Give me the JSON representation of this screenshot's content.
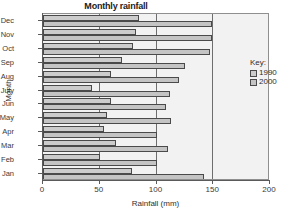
{
  "chart_data": {
    "type": "bar",
    "orientation": "horizontal",
    "title": "Monthly rainfall",
    "xlabel": "Rainfall (mm)",
    "ylabel": "Month",
    "xlim": [
      0,
      200
    ],
    "xticks": [
      0,
      50,
      100,
      150,
      200
    ],
    "xtick_labels": [
      "0",
      "50",
      "100",
      "150",
      "200"
    ],
    "grid": "vertical gridlines at 50, 100, 150",
    "legend_position": "right",
    "legend_title": "Key:",
    "categories": [
      "Jan",
      "Feb",
      "Mar",
      "Apr",
      "May",
      "Jun",
      "July",
      "Aug",
      "Sep",
      "Oct",
      "Nov",
      "Dec"
    ],
    "display_order_top_to_bottom": [
      "Dec",
      "Nov",
      "Oct",
      "Sep",
      "Aug",
      "July",
      "Jun",
      "May",
      "Apr",
      "Mar",
      "Feb",
      "Jan"
    ],
    "series": [
      {
        "name": "1990",
        "color": "#cccccc",
        "values": [
          78,
          50,
          64,
          54,
          56,
          60,
          43,
          60,
          70,
          79,
          82,
          85
        ]
      },
      {
        "name": "2000",
        "color": "#c4c4c4",
        "values": [
          142,
          100,
          110,
          100,
          113,
          108,
          112,
          120,
          125,
          147,
          149,
          149
        ]
      }
    ]
  },
  "legend": {
    "title": "Key:",
    "items": [
      {
        "label": "1990",
        "color": "#cccccc"
      },
      {
        "label": "2000",
        "color": "#c4c4c4"
      }
    ]
  },
  "axis": {
    "x_title": "Rainfall (mm)",
    "y_title": "Month"
  },
  "colors": {
    "plot_background": "#f2f2f2",
    "plot_border": "#8f8f8f",
    "gridline": "#6e6e6e",
    "bar_border": "#4a4a4a",
    "axis": "#5a5a5a",
    "text": "#2f2f2f"
  }
}
